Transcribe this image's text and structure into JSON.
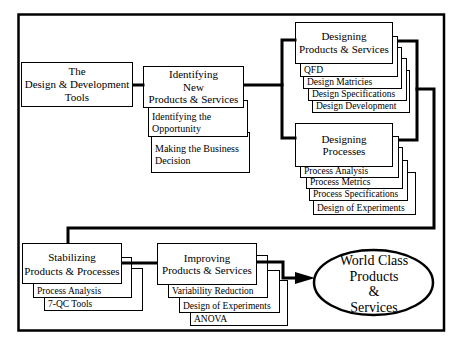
{
  "nodes": {
    "root": {
      "lines": [
        "The",
        "Design & Development",
        "Tools"
      ]
    },
    "identifying": {
      "lines": [
        "Identifying",
        "New",
        "Products & Services"
      ],
      "cards": [
        {
          "lines": [
            "Identifying the",
            "Opportunity"
          ]
        },
        {
          "lines": [
            "Making the Business",
            "Decision"
          ]
        }
      ]
    },
    "designing_products": {
      "lines": [
        "Designing",
        "Products & Services"
      ],
      "cards": [
        "QFD",
        "Design Matricies",
        "Design Specifications",
        "Design Development"
      ]
    },
    "designing_processes": {
      "lines": [
        "Designing",
        "Processes"
      ],
      "cards": [
        "Process Analysis",
        "Process Metrics",
        "Process Specifications",
        "Design of Experiments"
      ]
    },
    "stabilizing": {
      "lines": [
        "Stabilizing",
        "Products & Processes"
      ],
      "cards": [
        "Process Analysis",
        "7-QC Tools"
      ]
    },
    "improving": {
      "lines": [
        "Improving",
        "Products & Services"
      ],
      "cards": [
        "Variability Reduction",
        "Design of Experiments",
        "ANOVA"
      ]
    },
    "goal": {
      "lines": [
        "World Class",
        "Products",
        "&",
        "Services"
      ]
    }
  },
  "colors": {
    "stroke": "#000000",
    "fill": "#ffffff",
    "text": "#000000"
  }
}
